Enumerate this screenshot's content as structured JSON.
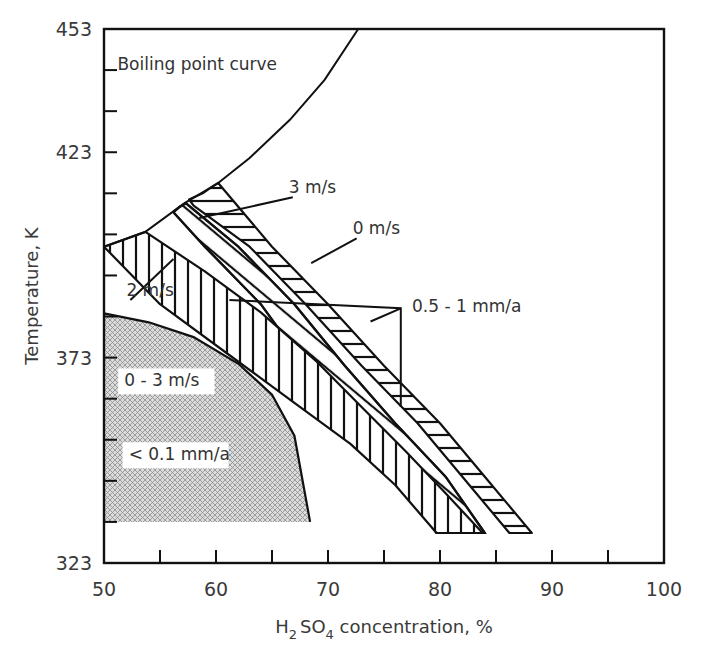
{
  "chart_data": {
    "type": "area",
    "title": "",
    "xlabel": "H2SO4 concentration, %",
    "xlabel_parts": {
      "pre": "H",
      "sub1": "2",
      "mid": "SO",
      "sub2": "4",
      "post": " concentration, %"
    },
    "ylabel": "Temperature, K",
    "xlim": [
      50,
      100
    ],
    "ylim": [
      323,
      453
    ],
    "x_ticks": [
      50,
      60,
      70,
      80,
      90,
      100
    ],
    "x_minor_ticks": [
      55,
      65,
      75,
      85,
      95
    ],
    "y_ticks": [
      323,
      373,
      423,
      453
    ],
    "y_minor_ticks": [
      333,
      343,
      353,
      363,
      383,
      393,
      403,
      413,
      433,
      443
    ],
    "grid": false,
    "legend": "none (inline annotations)",
    "series": [
      {
        "name": "Boiling point curve",
        "kind": "line",
        "points": [
          [
            50,
            400
          ],
          [
            53.7,
            403.6
          ],
          [
            57.2,
            410.6
          ],
          [
            60.2,
            415.5
          ],
          [
            63,
            421.6
          ],
          [
            66.6,
            430.9
          ],
          [
            69.7,
            440.6
          ],
          [
            72.7,
            453
          ]
        ]
      },
      {
        "name": "0 m/s",
        "kind": "band",
        "hatch": "horizontal",
        "polygon": [
          [
            60.2,
            415.5
          ],
          [
            65,
            400
          ],
          [
            70,
            386
          ],
          [
            75,
            371
          ],
          [
            80,
            357
          ],
          [
            84,
            344
          ],
          [
            88.2,
            330.3
          ],
          [
            86.2,
            330.3
          ],
          [
            82,
            344
          ],
          [
            78,
            357
          ],
          [
            73,
            371
          ],
          [
            68,
            386
          ],
          [
            63,
            400
          ],
          [
            58,
            410
          ],
          [
            57.6,
            411.5
          ],
          [
            58.8,
            413
          ],
          [
            59.6,
            414.5
          ]
        ]
      },
      {
        "name": "3 m/s",
        "kind": "band",
        "hatch": "diagonal-cross",
        "polygon": [
          [
            57.3,
            410.6
          ],
          [
            62,
            400
          ],
          [
            67,
            386
          ],
          [
            71.5,
            371
          ],
          [
            76,
            357
          ],
          [
            80.5,
            344
          ],
          [
            84,
            330.3
          ],
          [
            83,
            330.3
          ],
          [
            79.7,
            330.3
          ],
          [
            76,
            344
          ],
          [
            72,
            357
          ],
          [
            68,
            371
          ],
          [
            64,
            386
          ],
          [
            59,
            400
          ],
          [
            56.2,
            408.4
          ],
          [
            56.7,
            409.6
          ]
        ]
      },
      {
        "name": "2 m/s",
        "kind": "band",
        "hatch": "vertical",
        "polygon": [
          [
            53.7,
            403.6
          ],
          [
            59,
            394
          ],
          [
            64,
            384
          ],
          [
            69,
            372
          ],
          [
            73,
            361
          ],
          [
            77,
            350
          ],
          [
            80.5,
            340
          ],
          [
            83.8,
            330.3
          ],
          [
            79.7,
            330.3
          ],
          [
            76,
            342
          ],
          [
            72,
            352
          ],
          [
            67,
            362
          ],
          [
            61,
            374
          ],
          [
            55,
            386
          ],
          [
            50,
            400
          ]
        ]
      },
      {
        "name": "< 0.1 mm/a (0 - 3 m/s)",
        "kind": "region",
        "fill": "crosshatch-gray",
        "polygon": [
          [
            50,
            383.8
          ],
          [
            54,
            381.6
          ],
          [
            58,
            378
          ],
          [
            62,
            371.5
          ],
          [
            65,
            364
          ],
          [
            67,
            354
          ],
          [
            68.4,
            333
          ],
          [
            50,
            333
          ]
        ]
      }
    ],
    "annotations": [
      {
        "text": "Boiling point curve",
        "x": 51.2,
        "y": 443
      },
      {
        "text": "3 m/s",
        "x": 66.5,
        "y": 413,
        "arrow_to": [
          58.5,
          407
        ]
      },
      {
        "text": "0 m/s",
        "x": 72.2,
        "y": 403,
        "arrow_to": [
          68.5,
          396
        ]
      },
      {
        "text": "2 m/s",
        "x": 52,
        "y": 388,
        "arrow_to": [
          56.2,
          397
        ]
      },
      {
        "text": "0.5 - 1 mm/a",
        "x": 77.5,
        "y": 384
      },
      {
        "text": "0 - 3 m/s",
        "x": 51.8,
        "y": 366
      },
      {
        "text": "< 0.1 mm/a",
        "x": 52.2,
        "y": 348
      }
    ],
    "bracket_0_5_1": {
      "from": [
        61.2,
        387
      ],
      "corner": [
        76.5,
        385
      ],
      "down_to": [
        76.5,
        361
      ],
      "arrow_to": [
        73.8,
        381.8
      ]
    }
  },
  "labels": {
    "y_axis_title": "Temperature, K"
  }
}
